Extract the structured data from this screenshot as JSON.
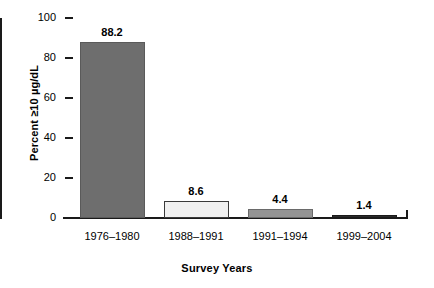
{
  "chart_data": {
    "type": "bar",
    "title": "",
    "subtitle": "",
    "xlabel": "Survey Years",
    "ylabel": "Percent ≥10 µg/dL",
    "categories": [
      "1976–1980",
      "1988–1991",
      "1991–1994",
      "1999–2004"
    ],
    "values": [
      88.2,
      8.6,
      4.4,
      1.4
    ],
    "value_labels": [
      "88.2",
      "8.6",
      "4.4",
      "1.4"
    ],
    "bar_colors": [
      "#6e6e6e",
      "#f0f0f0",
      "#949494",
      "#2b2b2b"
    ],
    "bar_border_colors": [
      "#5a5a5a",
      "#3a3a3a",
      "#6a6a6a",
      "#1a1a1a"
    ],
    "ylim": [
      0,
      100
    ],
    "ytick_values": [
      0,
      20,
      40,
      60,
      80,
      100
    ],
    "ytick_labels": [
      "0",
      "20",
      "40",
      "60",
      "80",
      "100"
    ],
    "grid": false,
    "legend": "none",
    "axis_color": "#1a1a1a",
    "background_color": "#ffffff"
  }
}
